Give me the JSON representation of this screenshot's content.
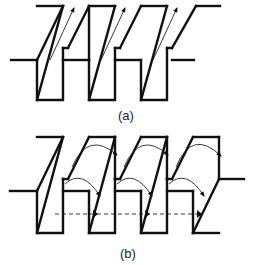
{
  "figure": {
    "panels": [
      {
        "id": "a",
        "label": "(a)",
        "description": "Series of slanted parallelogram blocks with straight arrows along the slanted faces"
      },
      {
        "id": "b",
        "label": "(b)",
        "description": "Series of slanted parallelogram blocks with curved arrows across tops and mid-levels, and a dashed horizontal line with arrowheads"
      }
    ],
    "colors": {
      "stroke": "#111111",
      "background": "#ffffff"
    }
  }
}
